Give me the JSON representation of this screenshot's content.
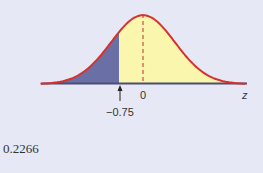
{
  "chart_data": {
    "type": "area",
    "title": "",
    "distribution": "standard normal",
    "mean": 0,
    "sd": 1,
    "shaded_region": {
      "from": "-inf",
      "to": -0.75,
      "area": 0.2266
    },
    "xlabel": "z",
    "x_ticks": [
      {
        "value": 0,
        "label": "0"
      },
      {
        "value": -0.75,
        "label": "−0.75"
      }
    ],
    "xlim": [
      -3.2,
      3.2
    ],
    "colors": {
      "curve": "#d8312c",
      "shaded": "#6a70a6",
      "unshaded": "#fbf6ad",
      "baseline": "#4a4f72",
      "mean_line": "#c0312c",
      "background": "#e6e9f5"
    }
  },
  "labels": {
    "zero": "0",
    "axis": "z",
    "cut": "−0.75",
    "answer": "0.2266"
  }
}
